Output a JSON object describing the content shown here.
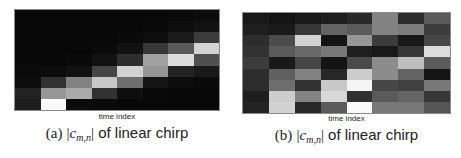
{
  "chart_data": [
    {
      "type": "heatmap",
      "title": "(a) |c_{m,n}| of linear chirp",
      "xlabel": "time index",
      "ylabel": "",
      "grid": false,
      "legend": null,
      "colormap": "grayscale (black = 0, white = max)",
      "n_cols": 8,
      "n_rows": 9,
      "row_order": "top-to-bottom",
      "values": [
        [
          8,
          8,
          8,
          8,
          8,
          8,
          10,
          12
        ],
        [
          8,
          8,
          8,
          8,
          8,
          10,
          14,
          18
        ],
        [
          8,
          8,
          8,
          8,
          10,
          14,
          28,
          60
        ],
        [
          8,
          8,
          8,
          10,
          18,
          55,
          90,
          210
        ],
        [
          8,
          8,
          10,
          18,
          45,
          160,
          220,
          80
        ],
        [
          10,
          12,
          18,
          70,
          210,
          150,
          35,
          25
        ],
        [
          12,
          50,
          130,
          200,
          110,
          20,
          12,
          10
        ],
        [
          35,
          150,
          170,
          50,
          15,
          10,
          8,
          8
        ],
        [
          30,
          250,
          12,
          10,
          8,
          8,
          8,
          8
        ]
      ]
    },
    {
      "type": "heatmap",
      "title": "(b) |c_{m,n}| of linear chirp",
      "xlabel": "time index",
      "ylabel": "",
      "grid": false,
      "legend": null,
      "colormap": "grayscale (black = 0, white = max)",
      "n_cols": 8,
      "n_rows": 9,
      "row_order": "top-to-bottom",
      "values": [
        [
          25,
          20,
          25,
          30,
          40,
          130,
          45,
          90
        ],
        [
          30,
          25,
          55,
          100,
          90,
          130,
          125,
          60
        ],
        [
          45,
          75,
          210,
          20,
          150,
          60,
          25,
          70
        ],
        [
          50,
          90,
          105,
          120,
          30,
          25,
          55,
          220
        ],
        [
          60,
          25,
          70,
          20,
          75,
          140,
          190,
          90
        ],
        [
          45,
          95,
          130,
          40,
          205,
          140,
          100,
          20
        ],
        [
          45,
          110,
          50,
          200,
          245,
          70,
          65,
          120
        ],
        [
          30,
          205,
          130,
          215,
          50,
          90,
          100,
          55
        ],
        [
          35,
          210,
          40,
          90,
          250,
          120,
          120,
          85
        ]
      ]
    }
  ],
  "panels": [
    {
      "xlabel": "time index",
      "caption": {
        "label": "(a)",
        "math_open": "|",
        "math_var": "c",
        "math_sub": "m,n",
        "math_close": "|",
        "text": " of linear chirp"
      }
    },
    {
      "xlabel": "time index",
      "caption": {
        "label": "(b)",
        "math_open": "|",
        "math_var": "c",
        "math_sub": "m,n",
        "math_close": "|",
        "text": " of linear chirp"
      }
    }
  ]
}
